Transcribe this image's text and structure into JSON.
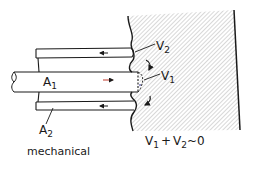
{
  "diagram": {
    "labels": {
      "a1": "A",
      "a1_sub": "1",
      "a2": "A",
      "a2_sub": "2",
      "v1": "V",
      "v1_sub": "1",
      "v2": "V",
      "v2_sub": "2",
      "caption": "mechanical",
      "equation_v1": "V",
      "equation_v1_sub": "1",
      "equation_plus": "+",
      "equation_v2": "V",
      "equation_v2_sub": "2",
      "equation_rest": "~0"
    },
    "colors": {
      "line": "#1a1a1a",
      "hatch": "#9a9a9a",
      "arrow_inner": "#c0392b",
      "arrow_outer": "#1a1a1a",
      "v1_marker": "#3a3aa0"
    }
  }
}
